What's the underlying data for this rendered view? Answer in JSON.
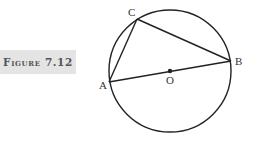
{
  "figure": {
    "label": "Figure 7.12"
  },
  "diagram": {
    "circle": {
      "cx": 170,
      "cy": 71,
      "r": 61
    },
    "points": {
      "A": {
        "label": "A",
        "x": 109,
        "y": 82
      },
      "B": {
        "label": "B",
        "x": 231,
        "y": 61
      },
      "C": {
        "label": "C",
        "x": 137,
        "y": 19
      },
      "O": {
        "label": "O",
        "x": 170,
        "y": 71
      }
    },
    "segments": [
      [
        "A",
        "B"
      ],
      [
        "A",
        "C"
      ],
      [
        "C",
        "B"
      ]
    ]
  }
}
